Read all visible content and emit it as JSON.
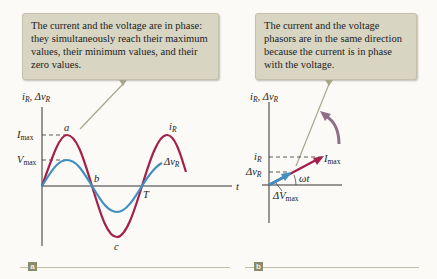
{
  "callouts": {
    "a": "The current and the voltage are in phase: they simultaneously reach their maximum values, their minimum values, and their zero values.",
    "b": "The current and the voltage phasors are in the same direction because the current is in phase with the voltage."
  },
  "panel_a": {
    "tag": "a",
    "y_axis_label": "iR, ΔvR",
    "x_axis_label": "t",
    "levels": {
      "imax": "Imax",
      "vmax": "Vmax"
    },
    "points": {
      "a": "a",
      "b": "b",
      "c": "c",
      "T": "T"
    },
    "curves": [
      {
        "name": "iR",
        "color": "#a3204d"
      },
      {
        "name": "ΔvR",
        "color": "#3f8fc0"
      }
    ]
  },
  "panel_b": {
    "tag": "b",
    "y_axis_label": "iR, ΔvR",
    "levels": {
      "iR": "iR",
      "dvR": "ΔvR"
    },
    "phasors": [
      {
        "name": "Imax",
        "color": "#a3204d"
      },
      {
        "name": "ΔVmax",
        "color": "#3f8fc0"
      }
    ],
    "angle_label": "ωt",
    "rotation_arrow_color": "#8e6f86"
  }
}
